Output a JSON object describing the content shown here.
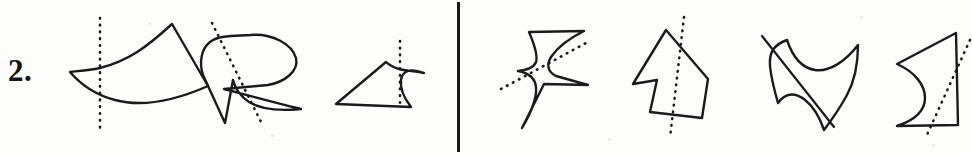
{
  "page": {
    "background_color": "#fdfdfc",
    "ink_color": "#1b1b1d",
    "width": 972,
    "height": 154
  },
  "problem": {
    "number_label": "2.",
    "divider": {
      "orientation": "vertical",
      "x": 457,
      "color": "#18181a"
    }
  },
  "figures": [
    {
      "id": "figure-1",
      "group": "left",
      "name": "fan-wedge-with-vertical-dotted-line",
      "line_style": "dotted",
      "line_orientation": "vertical",
      "outline": "M 172 24 C 147 47 128 61 100 68 C 86 71 76 71 70 72 C 82 86 96 95 115 100 C 141 107 174 101 208 86 Z",
      "axis": "M 100 18 L 100 129"
    },
    {
      "id": "figure-2",
      "group": "left",
      "name": "r-shaped-blob-with-diagonal-dotted-line",
      "line_style": "dotted",
      "line_orientation": "diagonal",
      "outline": "M 250 35 C 272 33 292 44 296 58 C 299 71 285 82 268 85 L 224 89 C 243 94 276 103 301 109 C 281 111 262 110 249 102 C 240 96 235 88 233 80 L 225 123 L 203 75 C 199 63 201 49 210 42 C 219 35 235 36 250 35 Z",
      "axis": "M 212 23 L 262 124"
    },
    {
      "id": "figure-3",
      "group": "left",
      "name": "triangle-with-curved-notch-and-vertical-dotted-line",
      "line_style": "dotted",
      "line_orientation": "vertical",
      "outline": "M 386 62 L 336 104 L 411 107 C 404 98 400 88 401 80 C 402 72 409 67 424 73 C 416 71 406 71 399 69 C 393 67 389 65 386 62 Z",
      "axis": "M 400 41 L 400 103"
    },
    {
      "id": "figure-4",
      "group": "right",
      "name": "lightning-bolt-with-diagonal-dotted-line",
      "line_style": "dotted",
      "line_orientation": "diagonal",
      "outline": "M 529 32 L 584 31 C 570 38 557 48 551 57 C 546 65 548 72 556 76 L 588 85 L 544 84 L 522 128 C 532 111 537 97 536 87 C 535 78 529 73 518 71 C 528 70 534 67 536 62 C 538 56 535 46 529 32 Z",
      "axis": "M 501 89 L 588 42"
    },
    {
      "id": "figure-5",
      "group": "right",
      "name": "dart-quadrilateral-with-steep-dotted-line",
      "line_style": "dotted",
      "line_orientation": "steep-diagonal",
      "outline": "M 666 30 L 708 79 L 702 118 L 650 112 L 657 80 L 633 84 Z",
      "axis": "M 684 17 L 670 138"
    },
    {
      "id": "figure-6",
      "group": "right",
      "name": "curvy-hourglass-with-diagonal-solid-line",
      "line_style": "solid",
      "line_orientation": "diagonal",
      "outline": "M 787 40 C 793 58 802 68 815 70 C 829 72 845 62 858 45 C 858 66 854 82 847 95 C 839 110 830 122 824 130 C 820 118 813 106 804 99 C 794 92 785 93 778 103 C 774 89 771 77 770 66 C 769 53 773 45 787 40 Z",
      "axis": "M 762 36 L 834 127"
    },
    {
      "id": "figure-7",
      "group": "right",
      "name": "concave-quadrilateral-with-diagonal-dotted-line",
      "line_style": "dotted",
      "line_orientation": "diagonal",
      "outline": "M 956 33 L 897 64 C 915 72 925 85 925 98 C 925 111 915 120 897 126 L 958 125 Z",
      "axis": "M 970 40 L 926 137"
    }
  ],
  "specks": [
    {
      "x": 148,
      "y": 22,
      "size": 3
    },
    {
      "x": 271,
      "y": 134,
      "size": 3
    },
    {
      "x": 608,
      "y": 138,
      "size": 3
    },
    {
      "x": 860,
      "y": 16,
      "size": 3
    },
    {
      "x": 932,
      "y": 144,
      "size": 3
    }
  ]
}
